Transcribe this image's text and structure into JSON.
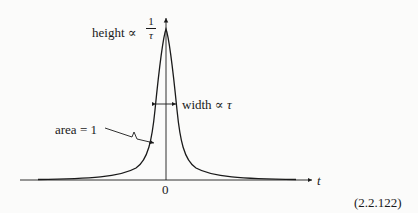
{
  "figure": {
    "height_label": "height ∝",
    "height_frac_num": "1",
    "height_frac_den": "τ",
    "width_label": "width ∝",
    "width_var": "τ",
    "area_label": "area = 1",
    "x_axis_label": "t",
    "origin_label": "0",
    "equation_number": "(2.2.122)"
  }
}
